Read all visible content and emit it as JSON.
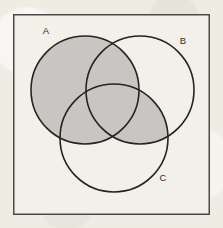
{
  "figure": {
    "kind": "venn-diagram",
    "set_count": 3,
    "shaded_expression": "A ∪ (B ∩ C)"
  },
  "canvas": {
    "width": 223,
    "height": 228,
    "background_color": "#efece4"
  },
  "universe_box": {
    "label": "",
    "x": 13,
    "y": 14,
    "width": 197,
    "height": 201,
    "fill_color": "#f2f0e9",
    "stroke_color": "#4a4a48",
    "stroke_width": 1.5
  },
  "style": {
    "circle_stroke_color": "#25241f",
    "circle_stroke_width": 1.6,
    "shaded_fill_color": "#c8c6c2",
    "unshaded_fill_color": "#f2f0e9",
    "label_color": "#2e2d2b"
  },
  "sets": [
    {
      "id": "A",
      "label": "A",
      "cx": 85,
      "cy": 90,
      "r": 54,
      "label_x": 46,
      "label_y": 34,
      "label_position": "outside-upper-left"
    },
    {
      "id": "B",
      "label": "B",
      "cx": 140,
      "cy": 90,
      "r": 54,
      "label_x": 183,
      "label_y": 44,
      "label_position": "outside-upper-right"
    },
    {
      "id": "C",
      "label": "C",
      "cx": 114,
      "cy": 138,
      "r": 54,
      "label_x": 163,
      "label_y": 181,
      "label_position": "inside-lower-right"
    }
  ],
  "regions": [
    {
      "id": "A-only",
      "name": "A only",
      "shaded": true
    },
    {
      "id": "B-only",
      "name": "B only",
      "shaded": false
    },
    {
      "id": "C-only",
      "name": "C only",
      "shaded": false
    },
    {
      "id": "A-and-B",
      "name": "A intersect B, not C",
      "shaded": true
    },
    {
      "id": "A-and-C",
      "name": "A intersect C, not B",
      "shaded": true
    },
    {
      "id": "B-and-C",
      "name": "B intersect C, not A",
      "shaded": true
    },
    {
      "id": "A-and-B-and-C",
      "name": "A intersect B intersect C",
      "shaded": true
    },
    {
      "id": "outside",
      "name": "outside all sets",
      "shaded": false
    }
  ]
}
